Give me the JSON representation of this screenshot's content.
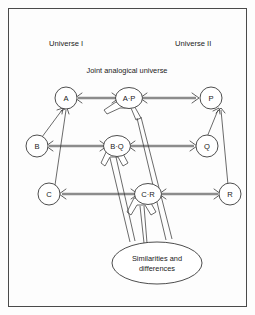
{
  "figure": {
    "background_color": "#fdfdfd",
    "border_color": "#4a4a4a"
  },
  "headings": {
    "left": "Universe I",
    "right": "Universe II",
    "center": "Joint analogical universe"
  },
  "nodes": {
    "a": "A",
    "b": "B",
    "c": "C",
    "ap": "A·P",
    "bq": "B·Q",
    "cr": "C·R",
    "p": "P",
    "q": "Q",
    "r": "R"
  },
  "ellipse": {
    "line1": "Similarities and",
    "line2": "differences"
  },
  "colors": {
    "thick_arrow": "#8c8c8c",
    "outline": "#3a3a3a",
    "text": "#1a1a1a",
    "node_fill": "#ffffff"
  },
  "structure": {
    "rows": [
      {
        "left": "A",
        "joint": "A·P",
        "right": "P"
      },
      {
        "left": "B",
        "joint": "B·Q",
        "right": "Q"
      },
      {
        "left": "C",
        "joint": "C·R",
        "right": "R"
      }
    ],
    "intra_universe_arrows": [
      "B→A",
      "C→A",
      "Q→P",
      "R→P"
    ],
    "joint_to_ellipse": [
      "A·P",
      "B·Q",
      "C·R"
    ]
  }
}
